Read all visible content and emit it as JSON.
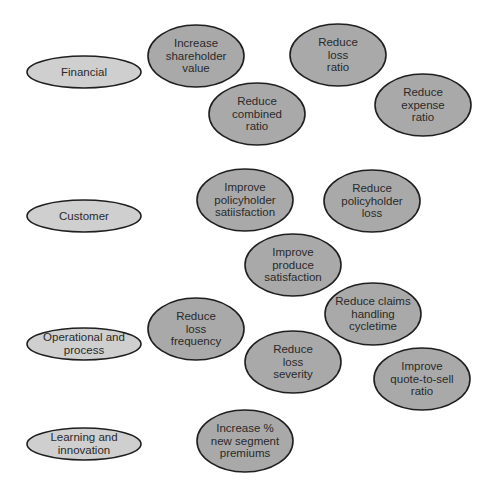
{
  "diagram": {
    "colors": {
      "background": "#ffffff",
      "perspective_fill": "#cfcfcf",
      "objective_fill": "#a9a9a9",
      "outline": "#1f1f1f",
      "text": "#2a2a2a"
    },
    "perspectives": [
      {
        "id": "financial",
        "label": "Financial",
        "cx": 84,
        "cy": 72,
        "rx": 57,
        "ry": 16
      },
      {
        "id": "customer",
        "label": "Customer",
        "cx": 84,
        "cy": 216,
        "rx": 57,
        "ry": 16
      },
      {
        "id": "operational",
        "label": "Operational and\nprocess",
        "cx": 84,
        "cy": 344,
        "rx": 57,
        "ry": 16
      },
      {
        "id": "learning",
        "label": "Learning and\ninnovation",
        "cx": 84,
        "cy": 444,
        "rx": 57,
        "ry": 16
      }
    ],
    "objectives": [
      {
        "id": "increase-shareholder-value",
        "perspective": "financial",
        "label": "Increase\nshareholder\nvalue",
        "cx": 196,
        "cy": 56,
        "rx": 48,
        "ry": 31
      },
      {
        "id": "reduce-loss-ratio",
        "perspective": "financial",
        "label": "Reduce\nloss\nratio",
        "cx": 338,
        "cy": 55,
        "rx": 48,
        "ry": 31
      },
      {
        "id": "reduce-combined-ratio",
        "perspective": "financial",
        "label": "Reduce\ncombined\nratio",
        "cx": 257,
        "cy": 114,
        "rx": 48,
        "ry": 31
      },
      {
        "id": "reduce-expense-ratio",
        "perspective": "financial",
        "label": "Reduce\nexpense\nratio",
        "cx": 423,
        "cy": 105,
        "rx": 48,
        "ry": 31
      },
      {
        "id": "improve-policyholder-satisfaction",
        "perspective": "customer",
        "label": "Improve\npolicyholder\nsatiisfaction",
        "cx": 245,
        "cy": 200,
        "rx": 48,
        "ry": 31
      },
      {
        "id": "reduce-policyholder-loss",
        "perspective": "customer",
        "label": "Reduce\npolicyholder\nloss",
        "cx": 372,
        "cy": 201,
        "rx": 48,
        "ry": 31
      },
      {
        "id": "improve-produce-satisfaction",
        "perspective": "customer",
        "label": "Improve\nproduce\nsatisfaction",
        "cx": 293,
        "cy": 265,
        "rx": 48,
        "ry": 31
      },
      {
        "id": "reduce-loss-frequency",
        "perspective": "operational",
        "label": "Reduce\nloss\nfrequency",
        "cx": 196,
        "cy": 329,
        "rx": 48,
        "ry": 31
      },
      {
        "id": "reduce-claims-handling-cycletime",
        "perspective": "operational",
        "label": "Reduce claims\nhandling\ncycletime",
        "cx": 373,
        "cy": 314,
        "rx": 48,
        "ry": 31
      },
      {
        "id": "reduce-loss-severity",
        "perspective": "operational",
        "label": "Reduce\nloss\nseverity",
        "cx": 293,
        "cy": 362,
        "rx": 48,
        "ry": 31
      },
      {
        "id": "improve-quote-to-sell-ratio",
        "perspective": "operational",
        "label": "Improve\nquote-to-sell\nratio",
        "cx": 422,
        "cy": 379,
        "rx": 48,
        "ry": 31
      },
      {
        "id": "increase-new-segment-premiums",
        "perspective": "learning",
        "label": "Increase %\nnew segment\npremiums",
        "cx": 245,
        "cy": 441,
        "rx": 48,
        "ry": 31
      }
    ]
  }
}
